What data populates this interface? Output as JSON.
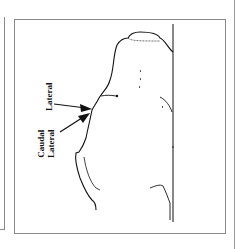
{
  "figure": {
    "labels": {
      "lateral": "Lateral",
      "caudal_lateral_line1": "Caudal",
      "caudal_lateral_line2": "Lateral"
    },
    "colors": {
      "ink": "#111111",
      "border": "#8a8a8a",
      "background": "#ffffff"
    }
  }
}
